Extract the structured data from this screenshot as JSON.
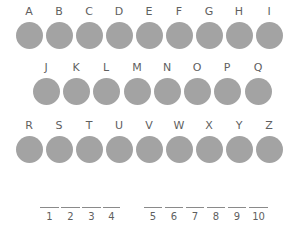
{
  "rows": [
    {
      "letters": [
        "A",
        "B",
        "C",
        "D",
        "E",
        "F",
        "G",
        "H",
        "I"
      ]
    },
    {
      "letters": [
        "J",
        "K",
        "L",
        "M",
        "N",
        "O",
        "P",
        "Q"
      ]
    },
    {
      "letters": [
        "R",
        "S",
        "T",
        "U",
        "V",
        "W",
        "X",
        "Y",
        "Z"
      ]
    }
  ],
  "circle_color": "#a3a3a3",
  "blanks": {
    "group1": [
      "1",
      "2",
      "3",
      "4"
    ],
    "group2": [
      "5",
      "6",
      "7",
      "8",
      "9",
      "10"
    ]
  }
}
